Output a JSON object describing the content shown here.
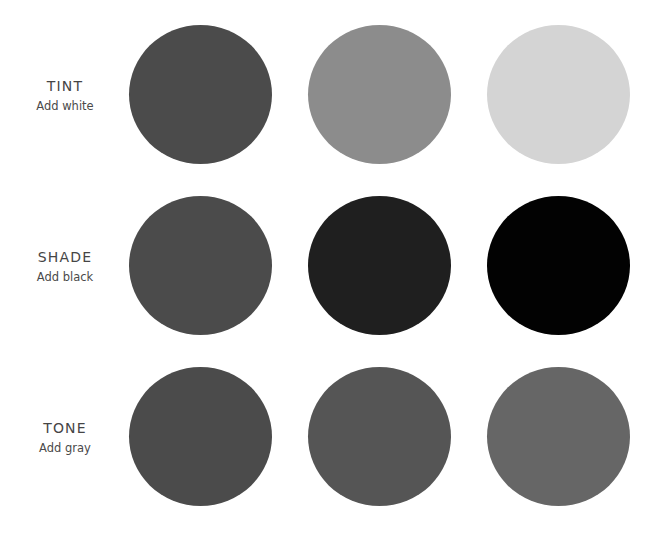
{
  "rows": [
    {
      "title": "TINT",
      "subtitle": "Add white",
      "swatches": [
        {
          "name": "base",
          "color": "#4b4b4b"
        },
        {
          "name": "tint-mid",
          "color": "#8c8c8c"
        },
        {
          "name": "tint-light",
          "color": "#d4d4d4"
        }
      ]
    },
    {
      "title": "SHADE",
      "subtitle": "Add black",
      "swatches": [
        {
          "name": "base",
          "color": "#4b4b4b"
        },
        {
          "name": "shade-mid",
          "color": "#1f1f1f"
        },
        {
          "name": "shade-dark",
          "color": "#020202"
        }
      ]
    },
    {
      "title": "TONE",
      "subtitle": "Add gray",
      "swatches": [
        {
          "name": "base",
          "color": "#4b4b4b"
        },
        {
          "name": "tone-mid",
          "color": "#555555"
        },
        {
          "name": "tone-light",
          "color": "#666666"
        }
      ]
    }
  ]
}
